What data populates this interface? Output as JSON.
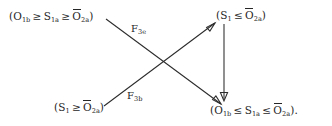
{
  "diagram": {
    "type": "commutative-diagram",
    "background_color": "#ffffff",
    "ink_color": "#262626",
    "nodes": [
      {
        "id": "top-left",
        "position": "top-left",
        "text": "(O1b ≥ S1a ≥ Ō2a)",
        "parts": {
          "open": "(",
          "term1_base": "O",
          "term1_sub": "1b",
          "rel1": "≥",
          "term2_base": "S",
          "term2_sub": "1a",
          "rel2": "≥",
          "term3_base": "O",
          "term3_sub": "2a",
          "term3_overbar": true,
          "close": ")"
        }
      },
      {
        "id": "top-right",
        "position": "top-right",
        "text": "(S1 ≤ Ō2a)",
        "parts": {
          "open": "(",
          "term1_base": "S",
          "term1_sub": "1",
          "rel1": "≤",
          "term2_base": "O",
          "term2_sub": "2a",
          "term2_overbar": true,
          "close": ")"
        }
      },
      {
        "id": "bottom-left",
        "position": "bottom-left",
        "text": "(S1 ≥ Ō2a)",
        "parts": {
          "open": "(",
          "term1_base": "S",
          "term1_sub": "1",
          "rel1": "≥",
          "term2_base": "O",
          "term2_sub": "2a",
          "term2_overbar": true,
          "close": ")"
        }
      },
      {
        "id": "bottom-right",
        "position": "bottom-right",
        "text": "(O1b ≤ S1a ≤ Ō2a).",
        "parts": {
          "open": "(",
          "term1_base": "O",
          "term1_sub": "1b",
          "rel1": "≤",
          "term2_base": "S",
          "term2_sub": "1a",
          "rel2": "≤",
          "term3_base": "O",
          "term3_sub": "2a",
          "term3_overbar": true,
          "close": ").",
          "trailing_period": true
        }
      }
    ],
    "edges": [
      {
        "id": "edge-f3e",
        "from": "top-left",
        "to": "bottom-right",
        "direction": "down-right",
        "label_base": "F",
        "label_sub": "3e",
        "label_text": "F3e"
      },
      {
        "id": "edge-f3b",
        "from": "bottom-left",
        "to": "top-right",
        "direction": "up-right",
        "label_base": "F",
        "label_sub": "3b",
        "label_text": "F3b"
      },
      {
        "id": "edge-vertical",
        "from": "top-right",
        "to": "bottom-right",
        "direction": "down",
        "label_text": ""
      }
    ]
  }
}
